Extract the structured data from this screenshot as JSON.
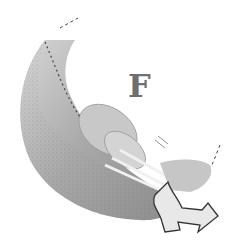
{
  "figure": {
    "label": "F",
    "colors": {
      "background": "#ffffff",
      "dark_shade": "#8a8a8a",
      "mid_shade": "#b5b5b5",
      "light_shade": "#d9d9d9",
      "outline": "#3a3a3a",
      "label": "#6f6f6f"
    }
  }
}
